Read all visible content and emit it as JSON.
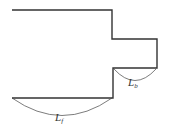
{
  "diagram": {
    "title": "",
    "shape": "stepped outline with protruding tab",
    "dimensions": [
      {
        "id": "lb",
        "symbol": "L",
        "subscript": "b",
        "spans": "lower edge of protruding tab"
      },
      {
        "id": "lf",
        "symbol": "L",
        "subscript": "f",
        "spans": "bottom edge of main body"
      }
    ]
  }
}
